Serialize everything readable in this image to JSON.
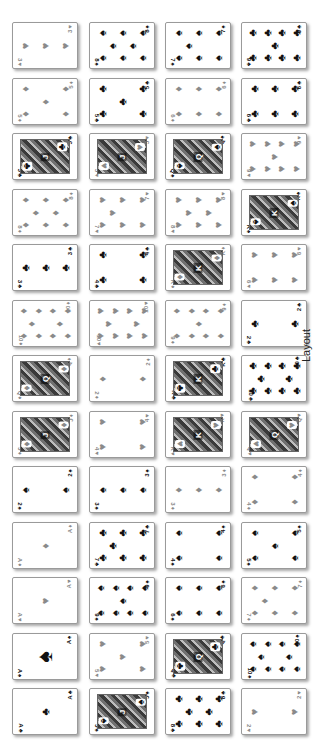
{
  "label": "Layout",
  "colors": {
    "red_suit": "#8a8a8a",
    "black_suit": "#111111",
    "card_bg": "#ffffff",
    "card_border": "#9a9a9a"
  },
  "grid": {
    "columns": 4,
    "rows": 13,
    "col_x": [
      12,
      89,
      165,
      241
    ],
    "row_y0": 22,
    "row_step": 55.5
  },
  "suits": {
    "S": "♠",
    "H": "♥",
    "D": "♦",
    "C": "♣"
  },
  "rows": [
    [
      {
        "rank": "3",
        "suit": "H"
      },
      {
        "rank": "8",
        "suit": "S"
      },
      {
        "rank": "7",
        "suit": "S"
      },
      {
        "rank": "9",
        "suit": "C"
      }
    ],
    [
      {
        "rank": "5",
        "suit": "D"
      },
      {
        "rank": "5",
        "suit": "C"
      },
      {
        "rank": "6",
        "suit": "D"
      },
      {
        "rank": "6",
        "suit": "C"
      }
    ],
    [
      {
        "rank": "J",
        "suit": "C"
      },
      {
        "rank": "J",
        "suit": "H"
      },
      {
        "rank": "Q",
        "suit": "S"
      },
      {
        "rank": "9",
        "suit": "H"
      }
    ],
    [
      {
        "rank": "8",
        "suit": "D"
      },
      {
        "rank": "7",
        "suit": "H"
      },
      {
        "rank": "8",
        "suit": "H"
      },
      {
        "rank": "K",
        "suit": "S"
      }
    ],
    [
      {
        "rank": "3",
        "suit": "C"
      },
      {
        "rank": "4",
        "suit": "C"
      },
      {
        "rank": "K",
        "suit": "D"
      },
      {
        "rank": "6",
        "suit": "H"
      }
    ],
    [
      {
        "rank": "10",
        "suit": "D"
      },
      {
        "rank": "10",
        "suit": "H"
      },
      {
        "rank": "9",
        "suit": "D"
      },
      {
        "rank": "2",
        "suit": "C"
      }
    ],
    [
      {
        "rank": "Q",
        "suit": "D"
      },
      {
        "rank": "2",
        "suit": "D"
      },
      {
        "rank": "K",
        "suit": "C"
      },
      {
        "rank": "10",
        "suit": "C"
      }
    ],
    [
      {
        "rank": "J",
        "suit": "D"
      },
      {
        "rank": "4",
        "suit": "H"
      },
      {
        "rank": "K",
        "suit": "H"
      },
      {
        "rank": "Q",
        "suit": "H"
      }
    ],
    [
      {
        "rank": "2",
        "suit": "S"
      },
      {
        "rank": "3",
        "suit": "S"
      },
      {
        "rank": "3",
        "suit": "D"
      },
      {
        "rank": "4",
        "suit": "D"
      }
    ],
    [
      {
        "rank": "A",
        "suit": "D"
      },
      {
        "rank": "7",
        "suit": "C"
      },
      {
        "rank": "4",
        "suit": "S"
      },
      {
        "rank": "5",
        "suit": "S"
      }
    ],
    [
      {
        "rank": "A",
        "suit": "H"
      },
      {
        "rank": "9",
        "suit": "S"
      },
      {
        "rank": "6",
        "suit": "S"
      },
      {
        "rank": "7",
        "suit": "D"
      }
    ],
    [
      {
        "rank": "A",
        "suit": "S"
      },
      {
        "rank": "5",
        "suit": "H"
      },
      {
        "rank": "Q",
        "suit": "C"
      },
      {
        "rank": "10",
        "suit": "S"
      }
    ],
    [
      {
        "rank": "A",
        "suit": "C"
      },
      {
        "rank": "J",
        "suit": "S"
      },
      {
        "rank": "8",
        "suit": "C"
      },
      {
        "rank": "2",
        "suit": "H"
      }
    ]
  ]
}
